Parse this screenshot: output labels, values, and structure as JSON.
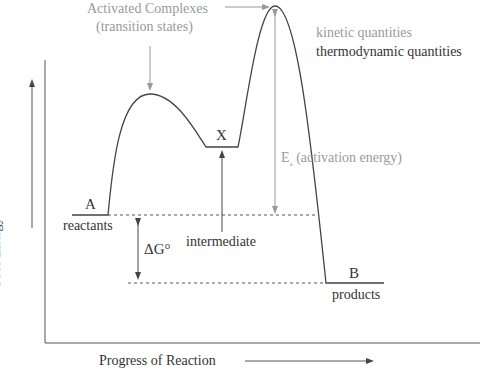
{
  "colors": {
    "dark": "#333333",
    "gray": "#9a9a9a",
    "dashed": "#555555"
  },
  "labels": {
    "activated_complexes_line1": "Activated Complexes",
    "activated_complexes_line2": "(transition states)",
    "legend_kinetic": "kinetic quantities",
    "legend_thermo": "thermodynamic quantities",
    "intermediate_symbol": "X",
    "intermediate_label": "intermediate",
    "activation_energy_symbol": "E",
    "activation_energy_subscript": "a",
    "activation_energy_text": "(activation energy)",
    "reactant_symbol": "A",
    "reactant_label": "reactants",
    "delta_g": "ΔG°",
    "product_symbol": "B",
    "product_label": "products",
    "y_axis_label": "Free Energy",
    "x_axis_label": "Progress of Reaction"
  },
  "levels": {
    "reactants_y": 215,
    "intermediate_y": 147,
    "products_y": 283,
    "ts1_peak_y": 94,
    "ts2_peak_y": 6
  }
}
